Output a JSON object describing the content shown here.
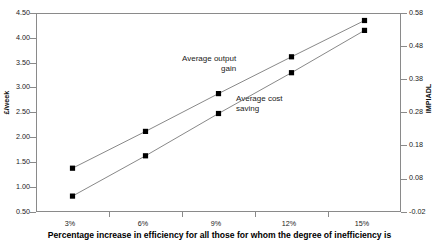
{
  "chart_data": {
    "type": "line",
    "title": "",
    "xlabel": "Percentage increase in efficiency for all those for whom the degree of inefficiency is",
    "ylabel": "£/week",
    "y2label": "IMPIADL",
    "categories": [
      "3%",
      "6%",
      "9%",
      "12%",
      "15%"
    ],
    "ylim": [
      0.5,
      4.5
    ],
    "yticks": [
      "0.50",
      "1.00",
      "1.50",
      "2.00",
      "2.50",
      "3.00",
      "3.50",
      "4.00",
      "4.50"
    ],
    "y2lim": [
      -0.02,
      0.58
    ],
    "y2ticks": [
      "-0.02",
      "0.08",
      "0.18",
      "0.28",
      "0.38",
      "0.48",
      "0.58"
    ],
    "grid": false,
    "legend": "annotations",
    "series": [
      {
        "name": "Average output gain",
        "axis": "left",
        "marker": "square",
        "color": "#000000",
        "line_color": "#7a7a7a",
        "values": [
          1.38,
          2.12,
          2.88,
          3.62,
          4.35
        ]
      },
      {
        "name": "Average cost saving",
        "axis": "right",
        "marker": "square",
        "color": "#000000",
        "line_color": "#7a7a7a",
        "values": [
          0.82,
          1.63,
          2.48,
          3.3,
          4.15
        ]
      }
    ],
    "annotations": [
      {
        "text": "Average output\ngain",
        "id": "annot-output"
      },
      {
        "text": "Average cost\nsaving",
        "id": "annot-cost"
      }
    ]
  },
  "axis": {
    "left_title": "£/week",
    "right_title": "IMPIADL",
    "bottom_title": "Percentage increase in efficiency for all those for whom the degree of inefficiency is"
  },
  "yticks_left": {
    "t0": "4.50",
    "t1": "4.00",
    "t2": "3.50",
    "t3": "3.00",
    "t4": "2.50",
    "t5": "2.00",
    "t6": "1.50",
    "t7": "1.00",
    "t8": "0.50"
  },
  "yticks_right": {
    "t0": "0.58",
    "t1": "0.48",
    "t2": "0.38",
    "t3": "0.28",
    "t4": "0.18",
    "t5": "0.08",
    "t6": "-0.02"
  },
  "xticks": {
    "t0": "3%",
    "t1": "6%",
    "t2": "9%",
    "t3": "12%",
    "t4": "15%"
  },
  "annot": {
    "output_line1": "Average output",
    "output_line2": "gain",
    "cost_line1": "Average cost",
    "cost_line2": "saving"
  }
}
